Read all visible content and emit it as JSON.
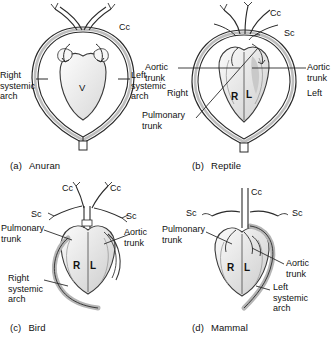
{
  "figure": {
    "background": "#ffffff",
    "ink": "#1a1a1a",
    "vessel_fill": "#b9b9b9",
    "chamber_fill": "#e8e8e8",
    "lumen_fill": "#fbfbfb"
  },
  "panels": [
    {
      "id": "a",
      "index_label": "(a)",
      "name": "Anuran",
      "chambers": [
        "V"
      ],
      "labels": [
        {
          "name": "cc",
          "text": "Cc"
        },
        {
          "name": "right-systemic-arch",
          "text": "Right\nsystemic\narch"
        },
        {
          "name": "left-systemic-arch",
          "text": "Left\nsystemic\narch"
        }
      ]
    },
    {
      "id": "b",
      "index_label": "(b)",
      "name": "Reptile",
      "chambers": [
        "R",
        "L"
      ],
      "labels": [
        {
          "name": "cc",
          "text": "Cc"
        },
        {
          "name": "sc",
          "text": "Sc"
        },
        {
          "name": "aortic-trunk-left",
          "text": "Aortic\ntrunk"
        },
        {
          "name": "aortic-trunk-right",
          "text": "Aortic\ntrunk"
        },
        {
          "name": "right",
          "text": "Right"
        },
        {
          "name": "left",
          "text": "Left"
        },
        {
          "name": "pulmonary-trunk",
          "text": "Pulmonary\ntrunk"
        }
      ]
    },
    {
      "id": "c",
      "index_label": "(c)",
      "name": "Bird",
      "chambers": [
        "R",
        "L"
      ],
      "labels": [
        {
          "name": "cc-left",
          "text": "Cc"
        },
        {
          "name": "cc-right",
          "text": "Cc"
        },
        {
          "name": "sc-left",
          "text": "Sc"
        },
        {
          "name": "sc-right",
          "text": "Sc"
        },
        {
          "name": "pulmonary-trunk",
          "text": "Pulmonary\ntrunk"
        },
        {
          "name": "aortic-trunk",
          "text": "Aortic\ntrunk"
        },
        {
          "name": "right-systemic-arch",
          "text": "Right\nsystemic\narch"
        }
      ]
    },
    {
      "id": "d",
      "index_label": "(d)",
      "name": "Mammal",
      "chambers": [
        "R",
        "L"
      ],
      "labels": [
        {
          "name": "cc",
          "text": "Cc"
        },
        {
          "name": "sc-left",
          "text": "Sc"
        },
        {
          "name": "sc-right",
          "text": "Sc"
        },
        {
          "name": "pulmonary-trunk",
          "text": "Pulmonary\ntrunk"
        },
        {
          "name": "aortic-trunk",
          "text": "Aortic\ntrunk"
        },
        {
          "name": "left-systemic-arch",
          "text": "Left\nsystemic\narch"
        }
      ]
    }
  ],
  "panel_a": {
    "cc": "Cc",
    "right_arch": "Right\nsystemic\narch",
    "left_arch": "Left\nsystemic\narch",
    "ventricle": "V",
    "index": "(a)",
    "name": "Anuran"
  },
  "panel_b": {
    "cc": "Cc",
    "sc": "Sc",
    "aortic_left": "Aortic\ntrunk",
    "aortic_right": "Aortic\ntrunk",
    "right": "Right",
    "left": "Left",
    "pulmonary": "Pulmonary\ntrunk",
    "chamber_r": "R",
    "chamber_l": "L",
    "index": "(b)",
    "name": "Reptile"
  },
  "panel_c": {
    "cc_left": "Cc",
    "cc_right": "Cc",
    "sc_left": "Sc",
    "sc_right": "Sc",
    "pulmonary": "Pulmonary\ntrunk",
    "aortic": "Aortic\ntrunk",
    "right_arch": "Right\nsystemic\narch",
    "chamber_r": "R",
    "chamber_l": "L",
    "index": "(c)",
    "name": "Bird"
  },
  "panel_d": {
    "cc": "Cc",
    "sc_left": "Sc",
    "sc_right": "Sc",
    "pulmonary": "Pulmonary\ntrunk",
    "aortic": "Aortic\ntrunk",
    "left_arch": "Left\nsystemic\narch",
    "chamber_r": "R",
    "chamber_l": "L",
    "index": "(d)",
    "name": "Mammal"
  }
}
